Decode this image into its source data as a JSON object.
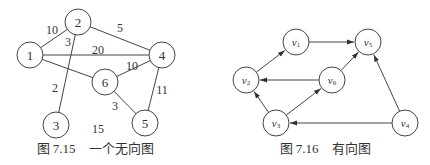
{
  "figure_7_15": {
    "caption": "图 7.15　一个无向图",
    "caption_pos": [
      95,
      148
    ],
    "nodes": [
      {
        "id": "1",
        "label": "1",
        "x": 30,
        "y": 55
      },
      {
        "id": "2",
        "label": "2",
        "x": 78,
        "y": 22
      },
      {
        "id": "3",
        "label": "3",
        "x": 56,
        "y": 125
      },
      {
        "id": "4",
        "label": "4",
        "x": 162,
        "y": 55
      },
      {
        "id": "5",
        "label": "5",
        "x": 145,
        "y": 123
      },
      {
        "id": "6",
        "label": "6",
        "x": 105,
        "y": 82
      }
    ],
    "radius": 13,
    "edges": [
      {
        "from": "1",
        "to": "2",
        "weight": "10",
        "lx": 52,
        "ly": 30
      },
      {
        "from": "2",
        "to": "4",
        "weight": "5",
        "lx": 120,
        "ly": 28
      },
      {
        "from": "1",
        "to": "4",
        "weight": "20",
        "lx": 98,
        "ly": 50
      },
      {
        "from": "2",
        "to": "3",
        "weight": "2",
        "lx": 55,
        "ly": 88
      },
      {
        "from": "1",
        "to": "6",
        "weight": "3",
        "lx": 68,
        "ly": 42
      },
      {
        "from": "6",
        "to": "4",
        "weight": "10",
        "lx": 132,
        "ly": 66
      },
      {
        "from": "6",
        "to": "5",
        "weight": "3",
        "lx": 115,
        "ly": 106
      },
      {
        "from": "4",
        "to": "5",
        "weight": "11",
        "lx": 162,
        "ly": 90
      }
    ],
    "extra_labels": [
      {
        "text": "15",
        "x": 98,
        "y": 129
      }
    ]
  },
  "figure_7_16": {
    "caption": "图 7.16　有向图",
    "caption_pos": [
      325,
      148
    ],
    "nodes": [
      {
        "id": "v1",
        "base": "v",
        "sub": "1",
        "x": 296,
        "y": 42
      },
      {
        "id": "v5",
        "base": "v",
        "sub": "5",
        "x": 368,
        "y": 42
      },
      {
        "id": "v2",
        "base": "v",
        "sub": "2",
        "x": 246,
        "y": 80
      },
      {
        "id": "v6",
        "base": "v",
        "sub": "6",
        "x": 332,
        "y": 80
      },
      {
        "id": "v3",
        "base": "v",
        "sub": "3",
        "x": 276,
        "y": 123
      },
      {
        "id": "v4",
        "base": "v",
        "sub": "4",
        "x": 405,
        "y": 123
      }
    ],
    "radius": 13,
    "edges": [
      {
        "from": "v1",
        "to": "v5"
      },
      {
        "from": "v2",
        "to": "v1"
      },
      {
        "from": "v6",
        "to": "v2"
      },
      {
        "from": "v6",
        "to": "v5"
      },
      {
        "from": "v3",
        "to": "v2"
      },
      {
        "from": "v3",
        "to": "v6"
      },
      {
        "from": "v4",
        "to": "v3"
      },
      {
        "from": "v4",
        "to": "v5"
      }
    ]
  }
}
